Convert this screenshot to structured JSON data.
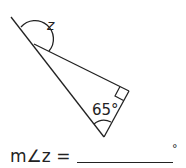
{
  "diagram": {
    "angle_label": "z",
    "given_angle": "65°",
    "right_angle_marker": true,
    "stroke_color": "#222222"
  },
  "question": {
    "prefix": "m∠z =",
    "degree_symbol": "°"
  }
}
